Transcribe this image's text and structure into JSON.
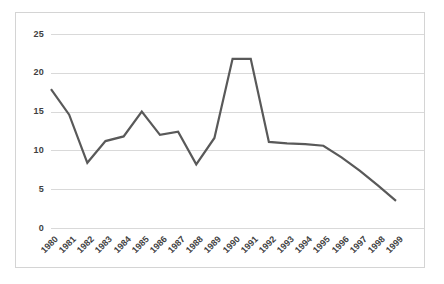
{
  "chart": {
    "title": "",
    "border_color": "#d4d4d4",
    "gridline_color": "#d9d9d9",
    "line_color": "#595959",
    "tick_text_color": "#3f3f3f"
  },
  "chart_data": {
    "type": "line",
    "title": "",
    "xlabel": "",
    "ylabel": "",
    "grid": true,
    "legend": false,
    "ylim": [
      0,
      25
    ],
    "yticks": [
      0,
      5,
      10,
      15,
      20,
      25
    ],
    "categories": [
      "1980",
      "1981",
      "1982",
      "1983",
      "1984",
      "1985",
      "1986",
      "1987",
      "1988",
      "1989",
      "1990",
      "1991",
      "1992",
      "1993",
      "1994",
      "1995",
      "1996",
      "1997",
      "1998",
      "1999"
    ],
    "series": [
      {
        "name": "",
        "color": "#595959",
        "values": [
          17.9,
          14.6,
          8.4,
          11.2,
          11.8,
          15.0,
          12.0,
          12.4,
          8.2,
          11.6,
          21.8,
          21.8,
          11.1,
          10.9,
          10.8,
          10.6,
          9.1,
          7.4,
          5.5,
          3.5
        ]
      }
    ]
  }
}
